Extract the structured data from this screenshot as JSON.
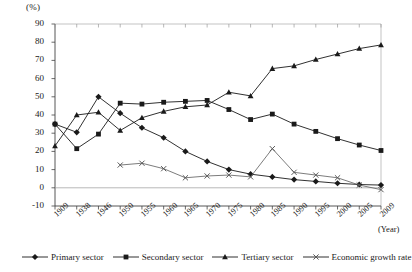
{
  "chart_data": {
    "type": "line",
    "title": "",
    "xlabel": "(Year)",
    "ylabel": "(%)",
    "ylim": [
      -10,
      90
    ],
    "yticks": [
      -10,
      0,
      10,
      20,
      30,
      40,
      50,
      60,
      70,
      80,
      90
    ],
    "grid": false,
    "legend_position": "bottom",
    "categories": [
      "1909",
      "1938",
      "1946",
      "1950",
      "1955",
      "1960",
      "1965",
      "1970",
      "1975",
      "1980",
      "1985",
      "1990",
      "1995",
      "2000",
      "2005",
      "2009"
    ],
    "series": [
      {
        "name": "Primary sector",
        "marker": "diamond",
        "color": "#1a1a1a",
        "values": [
          35.0,
          30.5,
          50.0,
          41.0,
          33.0,
          27.5,
          20.0,
          14.5,
          10.0,
          7.5,
          6.0,
          4.5,
          3.5,
          2.5,
          1.8,
          1.5
        ]
      },
      {
        "name": "Secondary sector",
        "marker": "square",
        "color": "#1a1a1a",
        "values": [
          35.0,
          21.5,
          29.5,
          46.5,
          46.0,
          47.0,
          47.5,
          48.0,
          43.0,
          37.5,
          40.5,
          35.0,
          31.0,
          27.0,
          23.5,
          20.5
        ]
      },
      {
        "name": "Tertiary sector",
        "marker": "triangle",
        "color": "#1a1a1a",
        "values": [
          23.0,
          40.0,
          41.5,
          31.5,
          38.5,
          42.0,
          44.5,
          45.5,
          52.5,
          50.5,
          65.5,
          67.0,
          70.5,
          73.5,
          76.5,
          78.5
        ]
      },
      {
        "name": "Economic growth rate",
        "marker": "cross",
        "color": "#5a5a5a",
        "values": [
          null,
          null,
          null,
          12.5,
          13.5,
          10.5,
          5.5,
          6.5,
          7.0,
          6.0,
          21.5,
          8.5,
          7.0,
          5.5,
          1.5,
          -1.0
        ]
      }
    ]
  },
  "legend": {
    "items": [
      {
        "label": "Primary sector",
        "marker": "diamond"
      },
      {
        "label": "Secondary sector",
        "marker": "square"
      },
      {
        "label": "Tertiary sector",
        "marker": "triangle"
      },
      {
        "label": "Economic growth rate",
        "marker": "cross"
      }
    ]
  }
}
